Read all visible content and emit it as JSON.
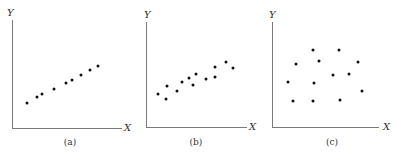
{
  "chart_data": [
    {
      "type": "scatter",
      "id": "a",
      "caption": "(a)",
      "xlabel": "X",
      "ylabel": "Y",
      "grid": false,
      "description": "strong positive linear relationship",
      "points_px": [
        [
          27,
          103
        ],
        [
          37,
          97
        ],
        [
          42,
          94
        ],
        [
          54,
          89
        ],
        [
          66,
          83
        ],
        [
          72,
          80
        ],
        [
          81,
          75
        ],
        [
          90,
          70
        ],
        [
          98,
          66
        ]
      ],
      "axes_px": {
        "origin": [
          12,
          128
        ],
        "x_end": 122,
        "y_top": 20,
        "xlabel_pos": [
          124,
          123
        ],
        "ylabel_pos": [
          7,
          8
        ],
        "caption_pos": [
          70,
          137
        ]
      }
    },
    {
      "type": "scatter",
      "id": "b",
      "caption": "(b)",
      "xlabel": "X",
      "ylabel": "Y",
      "grid": false,
      "description": "moderate positive linear relationship with more scatter",
      "points_px": [
        [
          158,
          94
        ],
        [
          166,
          99
        ],
        [
          167,
          86
        ],
        [
          177,
          91
        ],
        [
          182,
          82
        ],
        [
          189,
          78
        ],
        [
          193,
          85
        ],
        [
          196,
          74
        ],
        [
          206,
          79
        ],
        [
          215,
          77
        ],
        [
          215,
          67
        ],
        [
          226,
          62
        ],
        [
          233,
          68
        ]
      ],
      "axes_px": {
        "origin": [
          146,
          127
        ],
        "x_end": 247,
        "y_top": 22,
        "xlabel_pos": [
          249,
          122
        ],
        "ylabel_pos": [
          144,
          10
        ],
        "caption_pos": [
          196,
          137
        ]
      }
    },
    {
      "type": "scatter",
      "id": "c",
      "caption": "(c)",
      "xlabel": "X",
      "ylabel": "Y",
      "grid": false,
      "description": "no apparent relationship",
      "points_px": [
        [
          313,
          50
        ],
        [
          339,
          50
        ],
        [
          296,
          64
        ],
        [
          319,
          61
        ],
        [
          358,
          62
        ],
        [
          333,
          75
        ],
        [
          349,
          74
        ],
        [
          288,
          82
        ],
        [
          314,
          83
        ],
        [
          362,
          91
        ],
        [
          293,
          101
        ],
        [
          313,
          101
        ],
        [
          340,
          100
        ]
      ],
      "axes_px": {
        "origin": [
          272,
          127
        ],
        "x_end": 379,
        "y_top": 22,
        "xlabel_pos": [
          383,
          122
        ],
        "ylabel_pos": [
          269,
          10
        ],
        "caption_pos": [
          332,
          137
        ]
      }
    }
  ]
}
